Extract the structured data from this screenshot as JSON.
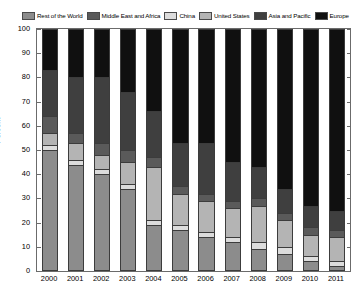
{
  "chart_data": {
    "type": "bar",
    "subtype": "stacked-bar-100-percent",
    "title": "",
    "xlabel": "",
    "ylabel": "Percent",
    "ylim": [
      0,
      100
    ],
    "yticks": [
      0,
      10,
      20,
      30,
      40,
      50,
      60,
      70,
      80,
      90,
      100
    ],
    "grid": false,
    "legend_position": "top",
    "categories": [
      "2000",
      "2001",
      "2002",
      "2003",
      "2004",
      "2005",
      "2006",
      "2007",
      "2008",
      "2009",
      "2010",
      "2011"
    ],
    "stack_order_bottom_to_top": [
      "Rest of the World",
      "China",
      "United States",
      "Middle East and Africa",
      "Asia and Pacific",
      "Europe"
    ],
    "series": [
      {
        "name": "Rest of the World",
        "color": "#8c8c8c",
        "values": [
          50,
          44,
          40,
          34,
          19,
          17,
          14,
          12,
          9,
          7,
          4,
          2
        ]
      },
      {
        "name": "China",
        "color": "#dcdcdc",
        "values": [
          2,
          2,
          2,
          2,
          2,
          2,
          2,
          2,
          3,
          3,
          2,
          2
        ]
      },
      {
        "name": "United States",
        "color": "#b4b4b4",
        "values": [
          5,
          7,
          6,
          9,
          22,
          13,
          13,
          12,
          15,
          11,
          9,
          10
        ]
      },
      {
        "name": "Middle East and Africa",
        "color": "#5a5a5a",
        "values": [
          7,
          4,
          5,
          5,
          4,
          3,
          3,
          3,
          3,
          3,
          3,
          3
        ]
      },
      {
        "name": "Asia and Pacific",
        "color": "#3f3f3f",
        "values": [
          19,
          23,
          27,
          24,
          19,
          18,
          21,
          16,
          13,
          10,
          9,
          8
        ]
      },
      {
        "name": "Europe",
        "color": "#101010",
        "values": [
          17,
          20,
          20,
          26,
          34,
          47,
          47,
          55,
          57,
          66,
          73,
          75
        ]
      }
    ]
  },
  "legend": {
    "entries": [
      {
        "label": "Rest of the World",
        "color": "#8c8c8c"
      },
      {
        "label": "Middle East and Africa",
        "color": "#5a5a5a"
      },
      {
        "label": "China",
        "color": "#dcdcdc"
      },
      {
        "label": "United States",
        "color": "#b4b4b4"
      },
      {
        "label": "Asia and Pacific",
        "color": "#3f3f3f"
      },
      {
        "label": "Europe",
        "color": "#101010"
      }
    ]
  },
  "axes": {
    "y_title": "Percent",
    "y_tick_labels": [
      "0",
      "10",
      "20",
      "30",
      "40",
      "50",
      "60",
      "70",
      "80",
      "90",
      "100"
    ],
    "x_tick_labels": [
      "2000",
      "2001",
      "2002",
      "2003",
      "2004",
      "2005",
      "2006",
      "2007",
      "2008",
      "2009",
      "2010",
      "2011"
    ]
  }
}
